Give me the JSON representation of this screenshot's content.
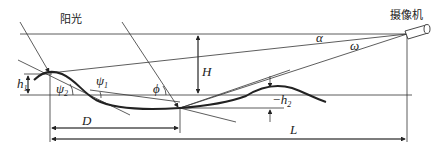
{
  "diagram": {
    "labels": {
      "sunlight": "阳光",
      "camera": "摄像机",
      "alpha": "α",
      "omega": "ω",
      "H": "H",
      "h1": "h",
      "h1_sub": "1",
      "phi": "ϕ",
      "psi1": "ψ",
      "psi1_sub": "1",
      "psi2": "ψ",
      "psi2_sub": "2",
      "neg_h2": "−h",
      "neg_h2_sub": "2",
      "D": "D",
      "L": "L"
    },
    "colors": {
      "line": "#333333",
      "background": "#ffffff"
    }
  }
}
